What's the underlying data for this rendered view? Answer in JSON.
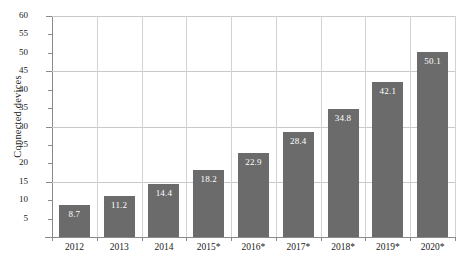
{
  "chart_data": {
    "type": "bar",
    "title": "",
    "xlabel": "",
    "ylabel": "Connected devices",
    "categories": [
      "2012",
      "2013",
      "2014",
      "2015*",
      "2016*",
      "2017*",
      "2018*",
      "2019*",
      "2020*"
    ],
    "values": [
      8.7,
      11.2,
      14.4,
      18.2,
      22.9,
      28.4,
      34.8,
      42.1,
      50.1
    ],
    "value_labels": [
      "8.7",
      "11.2",
      "14.4",
      "18.2",
      "22.9",
      "28.4",
      "34.8",
      "42.1",
      "50.1"
    ],
    "ylim": [
      0,
      60
    ],
    "y_ticks": [
      5,
      10,
      15,
      20,
      25,
      30,
      35,
      40,
      45,
      50,
      55,
      60
    ],
    "y_tick_labels": [
      "5",
      "10",
      "15",
      "20",
      "25",
      "30",
      "35",
      "40",
      "45",
      "50",
      "55",
      "60"
    ],
    "y_major_gridlines": [
      15,
      30,
      45,
      60
    ],
    "grid": true,
    "legend": "none",
    "bar_color": "#6b6b6b",
    "value_label_color": "#ffffff",
    "axis_color": "#8a8a8a",
    "grid_color": "#c9c9c9",
    "text_color": "#1a1a1a"
  }
}
